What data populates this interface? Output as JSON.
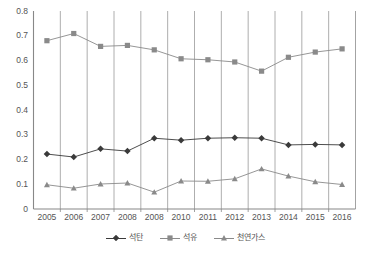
{
  "chart_data": {
    "type": "line",
    "title": "",
    "xlabel": "",
    "ylabel": "",
    "ylim": [
      0,
      0.8
    ],
    "ytick_step": 0.1,
    "grid": "vertical",
    "legend_position": "bottom",
    "categories": [
      "2005",
      "2006",
      "2007",
      "2008",
      "2008",
      "2010",
      "2011",
      "2012",
      "2013",
      "2014",
      "2015",
      "2016"
    ],
    "yticks": [
      "0.8",
      "0.7",
      "0.6",
      "0.5",
      "0.4",
      "0.3",
      "0.2",
      "0.1",
      "0"
    ],
    "series": [
      {
        "name": "석탄",
        "marker": "diamond",
        "color": "#3a3a3a",
        "values": [
          0.222,
          0.21,
          0.243,
          0.234,
          0.286,
          0.278,
          0.286,
          0.288,
          0.286,
          0.259,
          0.261,
          0.259
        ]
      },
      {
        "name": "석유",
        "marker": "square",
        "color": "#8a8a8a",
        "values": [
          0.68,
          0.709,
          0.657,
          0.661,
          0.643,
          0.607,
          0.603,
          0.594,
          0.557,
          0.613,
          0.634,
          0.647
        ]
      },
      {
        "name": "천연가스",
        "marker": "triangle",
        "color": "#8a8a8a",
        "values": [
          0.098,
          0.084,
          0.101,
          0.105,
          0.068,
          0.113,
          0.112,
          0.122,
          0.162,
          0.133,
          0.11,
          0.099
        ]
      }
    ]
  },
  "axes": {
    "axis_color": "#888888",
    "grid_color": "#999999",
    "tick_text_color": "#555555"
  }
}
